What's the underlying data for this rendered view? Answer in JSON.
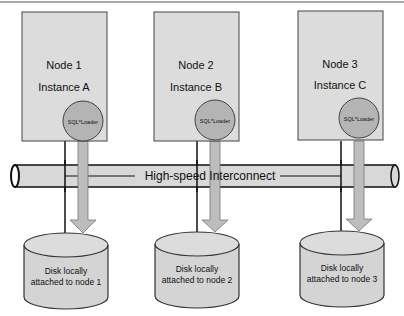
{
  "title": "",
  "interconnect": {
    "label": "High-speed Interconnect"
  },
  "nodes": [
    {
      "node": "Node 1",
      "instance": "Instance A",
      "tool": "SQL*Loader",
      "disk_line1": "Disk locally",
      "disk_line2": "attached to node 1"
    },
    {
      "node": "Node 2",
      "instance": "Instance B",
      "tool": "SQL*Loader",
      "disk_line1": "Disk locally",
      "disk_line2": "attached to node 2"
    },
    {
      "node": "Node 3",
      "instance": "Instance C",
      "tool": "SQL*Loader",
      "disk_line1": "Disk locally",
      "disk_line2": "attached to node 3"
    }
  ],
  "colors": {
    "box_fill": "#dcdcdc",
    "circle_fill": "#b4b4b4",
    "arrow_fill": "#bdbdbd",
    "stroke": "#333333"
  }
}
